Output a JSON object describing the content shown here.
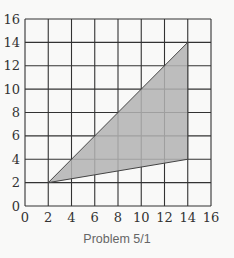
{
  "figure": {
    "caption": "Problem 5/1",
    "colors": {
      "background": "#f9f9f8",
      "grid_line": "#333333",
      "fill": "#b3b3b3",
      "outline": "#444444",
      "caption": "#666666"
    }
  },
  "chart_data": {
    "type": "area",
    "title": "",
    "caption": "Problem 5/1",
    "xlabel": "",
    "ylabel": "",
    "xlim": [
      0,
      16
    ],
    "ylim": [
      0,
      16
    ],
    "grid": true,
    "grid_step": 2,
    "x_ticks": [
      "0",
      "2",
      "4",
      "6",
      "8",
      "10",
      "12",
      "14",
      "16"
    ],
    "y_ticks": [
      "0",
      "2",
      "4",
      "6",
      "8",
      "10",
      "12",
      "14",
      "16"
    ],
    "shapes": [
      {
        "name": "shaded-triangle",
        "vertices": [
          [
            2,
            2
          ],
          [
            14,
            14
          ],
          [
            14,
            4
          ]
        ],
        "fill": "#b3b3b3"
      }
    ]
  }
}
